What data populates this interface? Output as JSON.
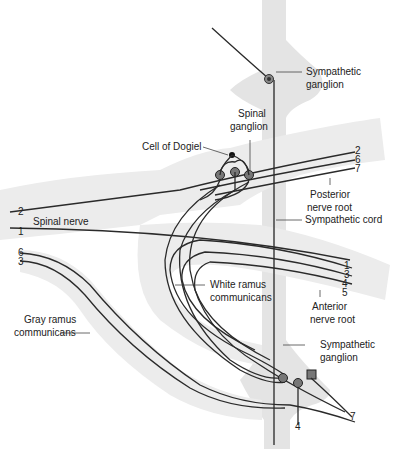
{
  "diagram": {
    "labels": {
      "sympathetic_ganglion_top": [
        "Sympathetic",
        "ganglion"
      ],
      "spinal_ganglion": [
        "Spinal",
        "ganglion"
      ],
      "cell_of_dogiel": "Cell of Dogiel",
      "posterior_nerve_root": [
        "Posterior",
        "nerve root"
      ],
      "sympathetic_cord": "Sympathetic cord",
      "spinal_nerve": "Spinal nerve",
      "white_ramus": [
        "White ramus",
        "communicans"
      ],
      "anterior_nerve_root": [
        "Anterior",
        "nerve root"
      ],
      "gray_ramus": [
        "Gray ramus",
        "communicans"
      ],
      "sympathetic_ganglion_bottom": [
        "Sympathetic",
        "ganglion"
      ]
    },
    "fiber_numbers": {
      "posterior_root": [
        "2",
        "6",
        "7"
      ],
      "spinal_nerve_left": [
        "2",
        "1"
      ],
      "gray_ramus_left": [
        "6",
        "3"
      ],
      "anterior_root": [
        "1",
        "3",
        "4",
        "5"
      ],
      "bottom": [
        "4",
        "7"
      ]
    },
    "colors": {
      "tissue": "#e4e4e4",
      "fiber": "#2a2a2a",
      "neuron_body": "#555555",
      "text": "#222222"
    }
  }
}
